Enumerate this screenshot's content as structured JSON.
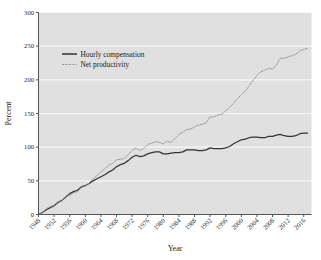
{
  "chart_data": {
    "type": "line",
    "title": "",
    "xlabel": "Year",
    "ylabel": "Percent",
    "xlim": [
      1948,
      2018
    ],
    "ylim": [
      0,
      300
    ],
    "grid": "horizontal",
    "legend_position": "upper-left-inside",
    "plot_background": "#e0e0e0",
    "figure_background": "#ffffff",
    "gridline_color": "#f7f7f7",
    "xticks": [
      1948,
      1952,
      1956,
      1960,
      1964,
      1968,
      1972,
      1976,
      1980,
      1984,
      1988,
      1992,
      1996,
      2000,
      2004,
      2008,
      2012,
      2016
    ],
    "xtick_labels": [
      "1948",
      "1952",
      "1956",
      "1960",
      "1964",
      "1968",
      "1972",
      "1976",
      "1980",
      "1984",
      "1988",
      "1992",
      "1996",
      "2000",
      "2004",
      "2008",
      "2012",
      "2016"
    ],
    "yticks": [
      0,
      50,
      100,
      150,
      200,
      250,
      300
    ],
    "ytick_labels": [
      "0",
      "50",
      "100",
      "150",
      "200",
      "250",
      "300"
    ],
    "series": [
      {
        "name": "Hourly compensation",
        "color": "#333333",
        "style": "solid",
        "x": [
          1948,
          1949,
          1950,
          1951,
          1952,
          1953,
          1954,
          1955,
          1956,
          1957,
          1958,
          1959,
          1960,
          1961,
          1962,
          1963,
          1964,
          1965,
          1966,
          1967,
          1968,
          1969,
          1970,
          1971,
          1972,
          1973,
          1974,
          1975,
          1976,
          1977,
          1978,
          1979,
          1980,
          1981,
          1982,
          1983,
          1984,
          1985,
          1986,
          1987,
          1988,
          1989,
          1990,
          1991,
          1992,
          1993,
          1994,
          1995,
          1996,
          1997,
          1998,
          1999,
          2000,
          2001,
          2002,
          2003,
          2004,
          2005,
          2006,
          2007,
          2008,
          2009,
          2010,
          2011,
          2012,
          2013,
          2014,
          2015,
          2016,
          2017
        ],
        "values": [
          0,
          3,
          7,
          10,
          13,
          18,
          21,
          26,
          31,
          34,
          36,
          41,
          43,
          46,
          50,
          53,
          56,
          59,
          63,
          66,
          71,
          74,
          76,
          80,
          85,
          88,
          86,
          87,
          90,
          92,
          93,
          93,
          90,
          90,
          91,
          92,
          92,
          93,
          96,
          96,
          96,
          95,
          95,
          96,
          99,
          98,
          98,
          98,
          99,
          101,
          105,
          108,
          111,
          112,
          114,
          115,
          115,
          114,
          114,
          116,
          116,
          118,
          119,
          117,
          116,
          116,
          117,
          120,
          121,
          121
        ]
      },
      {
        "name": "Net productivity",
        "color": "#9a9a9a",
        "style": "dashed",
        "x": [
          1948,
          1949,
          1950,
          1951,
          1952,
          1953,
          1954,
          1955,
          1956,
          1957,
          1958,
          1959,
          1960,
          1961,
          1962,
          1963,
          1964,
          1965,
          1966,
          1967,
          1968,
          1969,
          1970,
          1971,
          1972,
          1973,
          1974,
          1975,
          1976,
          1977,
          1978,
          1979,
          1980,
          1981,
          1982,
          1983,
          1984,
          1985,
          1986,
          1987,
          1988,
          1989,
          1990,
          1991,
          1992,
          1993,
          1994,
          1995,
          1996,
          1997,
          1998,
          1999,
          2000,
          2001,
          2002,
          2003,
          2004,
          2005,
          2006,
          2007,
          2008,
          2009,
          2010,
          2011,
          2012,
          2013,
          2014,
          2015,
          2016,
          2017
        ],
        "values": [
          0,
          2,
          9,
          12,
          14,
          19,
          21,
          27,
          28,
          32,
          34,
          40,
          42,
          47,
          53,
          58,
          63,
          68,
          73,
          76,
          81,
          82,
          83,
          89,
          95,
          99,
          95,
          98,
          104,
          106,
          108,
          107,
          105,
          109,
          107,
          113,
          119,
          122,
          126,
          127,
          130,
          133,
          134,
          136,
          145,
          145,
          148,
          149,
          154,
          159,
          165,
          172,
          178,
          183,
          191,
          199,
          206,
          212,
          214,
          217,
          216,
          222,
          232,
          232,
          234,
          236,
          238,
          243,
          245,
          247
        ]
      }
    ],
    "legend": [
      {
        "label": "Hourly compensation",
        "color": "#333333",
        "style": "solid"
      },
      {
        "label": "Net productivity",
        "color": "#9a9a9a",
        "style": "dashed"
      }
    ]
  }
}
